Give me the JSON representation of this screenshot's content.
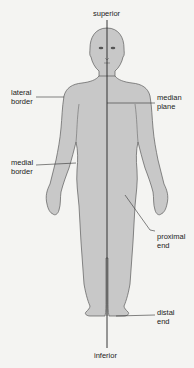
{
  "diagram": {
    "type": "anatomical-position-front-view",
    "colors": {
      "background": "#f4f4f2",
      "body_fill": "#c8c8c8",
      "outline": "#555555",
      "leader_line": "#333333",
      "text": "#222222"
    },
    "labels": {
      "superior": "superior",
      "inferior": "inferior",
      "lateral_border": "lateral\nborder",
      "median_plane": "median\nplane",
      "medial_border": "medial\nborder",
      "proximal_end": "proximal\nend",
      "distal_end": "distal\nend"
    }
  }
}
